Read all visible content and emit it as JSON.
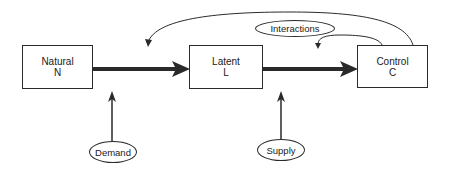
{
  "diagram": {
    "type": "flow",
    "nodes": [
      {
        "id": "natural",
        "label": "Natural",
        "symbol": "N",
        "shape": "box"
      },
      {
        "id": "latent",
        "label": "Latent",
        "symbol": "L",
        "shape": "box"
      },
      {
        "id": "control",
        "label": "Control",
        "symbol": "C",
        "shape": "box"
      },
      {
        "id": "demand",
        "label": "Demand",
        "shape": "ellipse"
      },
      {
        "id": "supply",
        "label": "Supply",
        "shape": "ellipse"
      },
      {
        "id": "interactions",
        "label": "Interactions",
        "shape": "ellipse"
      }
    ],
    "edges": [
      {
        "from": "natural",
        "to": "latent",
        "style": "thick"
      },
      {
        "from": "latent",
        "to": "control",
        "style": "thick"
      },
      {
        "from": "demand",
        "to": "natural-latent-edge",
        "style": "thin"
      },
      {
        "from": "supply",
        "to": "latent-control-edge",
        "style": "thin"
      },
      {
        "from": "control",
        "to": "natural-latent-edge",
        "style": "curved"
      },
      {
        "from": "control",
        "to": "latent-control-edge",
        "style": "curved",
        "label_ref": "interactions"
      }
    ],
    "colors": {
      "line": "#2a2a2a",
      "background": "#ffffff"
    }
  }
}
